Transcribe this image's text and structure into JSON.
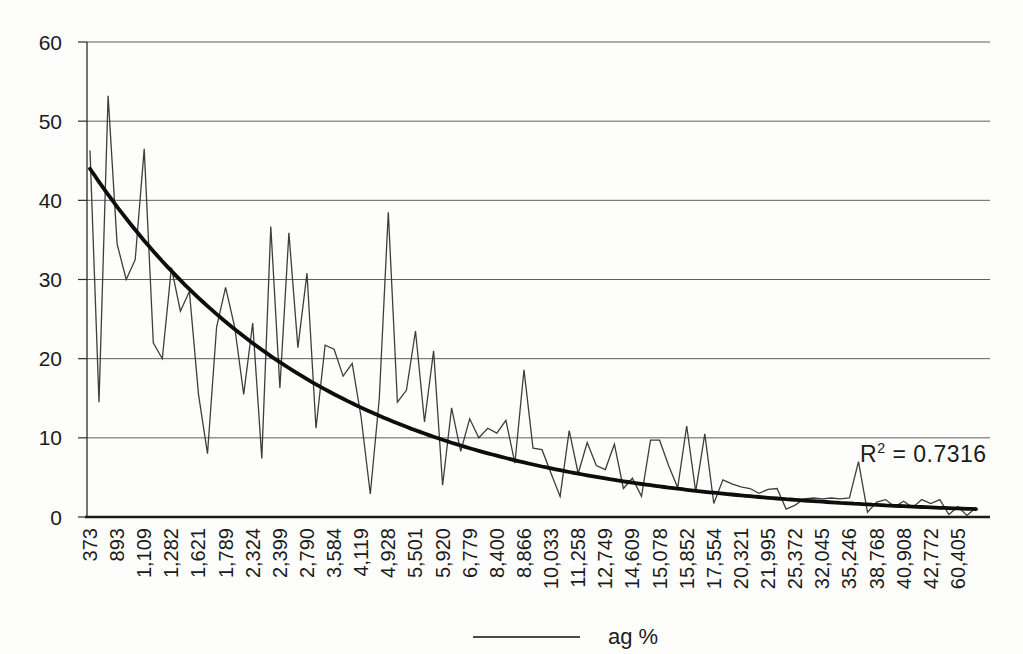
{
  "figure": {
    "legend": {
      "label": "ag %"
    },
    "annotation": {
      "r_squared_prefix": "R",
      "r_squared_sup": "2",
      "r_squared_eq": " = ",
      "r_squared": "0.7316"
    }
  },
  "chart_data": {
    "type": "line",
    "title": "",
    "xlabel": "",
    "ylabel": "",
    "ylim": [
      0,
      60
    ],
    "y_ticks": [
      "0",
      "10",
      "20",
      "30",
      "40",
      "50",
      "60"
    ],
    "grid": "horizontal",
    "legend_position": "bottom-center",
    "x_tick_labels": [
      "373",
      "893",
      "1,109",
      "1,282",
      "1,621",
      "1,789",
      "2,324",
      "2,399",
      "2,790",
      "3,584",
      "4,119",
      "4,928",
      "5,501",
      "5,920",
      "6,779",
      "8,400",
      "8,866",
      "10,033",
      "11,258",
      "12,749",
      "14,609",
      "15,078",
      "15,852",
      "17,554",
      "20,321",
      "21,995",
      "25,372",
      "32,045",
      "35,246",
      "38,768",
      "40,908",
      "42,772",
      "60,405"
    ],
    "x_label_every_n_points": 3,
    "series": [
      {
        "name": "ag %",
        "values": [
          46.3,
          14.5,
          53.2,
          34.5,
          30,
          32.5,
          46.5,
          22,
          20,
          31.5,
          26,
          28.5,
          15.5,
          8,
          24,
          29,
          24,
          15.5,
          24.5,
          7.4,
          36.7,
          16.3,
          35.9,
          21.4,
          30.8,
          11.2,
          21.7,
          21.2,
          17.8,
          19.4,
          12.5,
          2.9,
          15,
          38.5,
          14.5,
          16,
          23.5,
          12,
          21,
          4,
          13.8,
          8.3,
          12.4,
          10,
          11.2,
          10.6,
          12.2,
          6.8,
          18.6,
          8.7,
          8.5,
          5.5,
          2.6,
          10.9,
          5.5,
          9.4,
          6.5,
          6,
          9.2,
          3.6,
          4.9,
          2.6,
          9.7,
          9.7,
          6.5,
          3.7,
          11.5,
          3.2,
          10.5,
          1.7,
          4.7,
          4.2,
          3.8,
          3.6,
          3,
          3.5,
          3.6,
          1,
          1.5,
          2.3,
          2.4,
          2.3,
          2.4,
          2.3,
          2.4,
          7,
          0.6,
          1.9,
          2.2,
          1.3,
          2,
          1.2,
          2.2,
          1.7,
          2.2,
          0.3,
          1.3,
          0.2,
          1.2
        ]
      }
    ],
    "trendline": {
      "shape": "exponential-decay",
      "start_value": 44,
      "end_value": 1.0,
      "r_squared": 0.7316
    }
  }
}
